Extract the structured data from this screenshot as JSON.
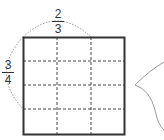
{
  "diagram": {
    "grid": {
      "columns": 3,
      "rows": 4
    },
    "top_fraction": {
      "numerator": "2",
      "denominator": "3"
    },
    "left_fraction": {
      "numerator": "3",
      "denominator": "4"
    },
    "colors": {
      "outline": "#333333",
      "dash": "#444444",
      "arc": "#777777",
      "bubble": "#999999"
    }
  }
}
